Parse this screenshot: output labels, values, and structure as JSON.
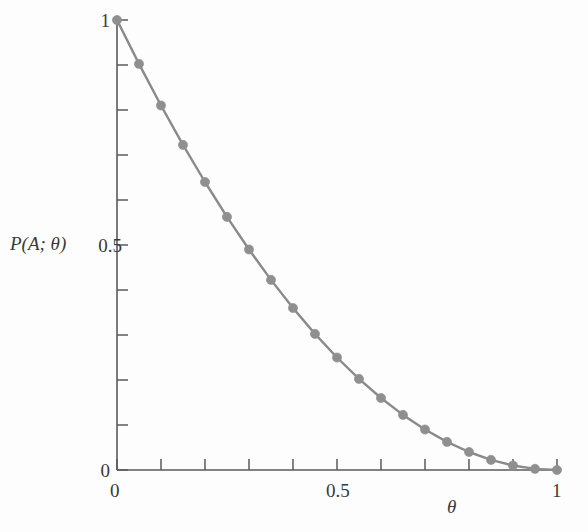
{
  "figure": {
    "background_color": "#fdfdfd",
    "line_color": "#8a8a8a",
    "marker_color": "#8f8f8f",
    "axis_color": "#5a5a5a"
  },
  "axes": {
    "y_title": "P(A; θ)",
    "x_title": "θ",
    "y_tick_labels": [
      "0",
      "0.5",
      "1"
    ],
    "x_tick_labels": [
      "0",
      "0.5",
      "1"
    ]
  },
  "chart_data": {
    "type": "line",
    "title": "",
    "subtitle": "",
    "xlabel": "θ",
    "ylabel": "P(A; θ)",
    "xlim": [
      0,
      1
    ],
    "ylim": [
      0,
      1
    ],
    "x_major_ticks": [
      0,
      0.5,
      1
    ],
    "y_major_ticks": [
      0,
      0.5,
      1
    ],
    "x_minor_ticks": [
      0.1,
      0.2,
      0.3,
      0.4,
      0.6,
      0.7,
      0.8,
      0.9
    ],
    "y_minor_ticks": [
      0.1,
      0.2,
      0.3,
      0.4,
      0.6,
      0.7,
      0.8,
      0.9
    ],
    "grid": false,
    "legend": null,
    "legend_position": "none",
    "marker": "circle",
    "x": [
      0,
      0.05,
      0.1,
      0.15,
      0.2,
      0.25,
      0.3,
      0.35,
      0.4,
      0.45,
      0.5,
      0.55,
      0.6,
      0.65,
      0.7,
      0.75,
      0.8,
      0.85,
      0.9,
      0.95,
      1
    ],
    "values": [
      1.0,
      0.9025,
      0.81,
      0.7225,
      0.64,
      0.5625,
      0.49,
      0.4225,
      0.36,
      0.3025,
      0.25,
      0.2025,
      0.16,
      0.1225,
      0.09,
      0.0625,
      0.04,
      0.0225,
      0.01,
      0.0025,
      0.0
    ],
    "series": [
      {
        "name": "P(A; θ)",
        "values": [
          1.0,
          0.9025,
          0.81,
          0.7225,
          0.64,
          0.5625,
          0.49,
          0.4225,
          0.36,
          0.3025,
          0.25,
          0.2025,
          0.16,
          0.1225,
          0.09,
          0.0625,
          0.04,
          0.0225,
          0.01,
          0.0025,
          0.0
        ]
      }
    ]
  }
}
